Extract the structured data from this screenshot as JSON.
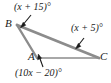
{
  "figure": {
    "type": "geometry-diagram",
    "shape": "triangle",
    "stroke_color": "#808080",
    "text_color": "#1a1a1a",
    "background_color": "#ffffff",
    "vertices": [
      {
        "name": "B",
        "label": "B",
        "x": 17,
        "y": 25
      },
      {
        "name": "A",
        "label": "A",
        "x": 37,
        "y": 58
      },
      {
        "name": "C",
        "label": "C",
        "x": 99,
        "y": 58
      }
    ],
    "angle_labels": [
      {
        "name": "angle-at-B",
        "text": "(x + 15)°",
        "points_to": "B"
      },
      {
        "name": "angle-at-C",
        "text": "(x + 5)°",
        "points_to": "C"
      },
      {
        "name": "angle-at-A",
        "text": "(10x − 20)°",
        "points_to": "A"
      }
    ]
  }
}
